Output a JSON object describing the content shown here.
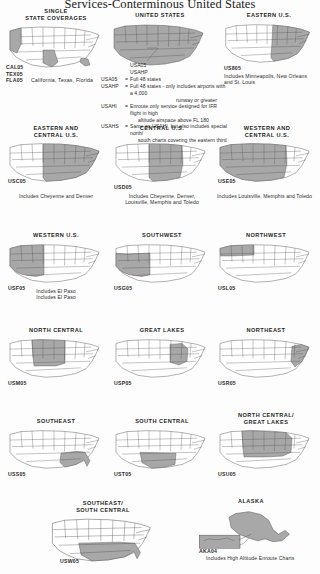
{
  "document": {
    "title": "Services-Conterminous United States"
  },
  "panels": [
    {
      "id": "single-state-coverages",
      "title": "SINGLE\nSTATE COVERAGES",
      "code": "",
      "caption": "",
      "shaded": [
        "CA",
        "TX",
        "FL"
      ]
    },
    {
      "id": "united-states",
      "title": "UNITED STATES",
      "code": "",
      "caption": "",
      "shaded": [
        "ALL48"
      ]
    },
    {
      "id": "eastern-us",
      "title": "EASTERN U.S.",
      "code": "US805",
      "caption": "Includes Minneapolis, New Orleans\nand St. Louis",
      "shaded": [
        "EAST"
      ]
    },
    {
      "id": "eastern-and-central-us",
      "title": "EASTERN AND\nCENTRAL U.S.",
      "code": "USC05",
      "caption": "Includes Cheyenne and Denver",
      "shaded": [
        "EASTCENTRAL"
      ]
    },
    {
      "id": "central-us",
      "title": "CENTRAL U.S.",
      "code": "USD05",
      "caption": "Includes Cheyenne, Denver,\nLouisville, Memphis and Toledo",
      "shaded": [
        "CENTRAL"
      ]
    },
    {
      "id": "western-and-central-us",
      "title": "WESTERN AND\nCENTRAL U.S.",
      "code": "USE05",
      "caption": "Includes Louisville, Memphis and Toledo",
      "shaded": [
        "WESTCENTRAL"
      ]
    },
    {
      "id": "western-us",
      "title": "WESTERN U.S.",
      "code": "USF05",
      "caption": "Includes El Paso",
      "shaded": [
        "WEST"
      ]
    },
    {
      "id": "southwest",
      "title": "SOUTHWEST",
      "code": "USG05",
      "caption": "",
      "shaded": [
        "SOUTHWEST"
      ]
    },
    {
      "id": "northwest",
      "title": "NORTHWEST",
      "code": "USL05",
      "caption": "",
      "shaded": [
        "NORTHWEST"
      ]
    },
    {
      "id": "north-central",
      "title": "NORTH CENTRAL",
      "code": "USM05",
      "caption": "",
      "shaded": [
        "NORTHCENTRAL"
      ]
    },
    {
      "id": "great-lakes",
      "title": "GREAT LAKES",
      "code": "USP05",
      "caption": "",
      "shaded": [
        "GREATLAKES"
      ]
    },
    {
      "id": "northeast",
      "title": "NORTHEAST",
      "code": "USR05",
      "caption": "",
      "shaded": [
        "NORTHEAST"
      ]
    },
    {
      "id": "southeast",
      "title": "SOUTHEAST",
      "code": "USS05",
      "caption": "",
      "shaded": [
        "SOUTHEAST"
      ]
    },
    {
      "id": "south-central",
      "title": "SOUTH CENTRAL",
      "code": "UST05",
      "caption": "",
      "shaded": [
        "SOUTHCENTRAL"
      ]
    },
    {
      "id": "north-central-great-lakes",
      "title": "NORTH CENTRAL/\nGREAT LAKES",
      "code": "USU05",
      "caption": "",
      "shaded": [
        "NCGL"
      ]
    },
    {
      "id": "southeast-south-central",
      "title": "SOUTHEAST/\nSOUTH CENTRAL",
      "code": "USW05",
      "caption": "",
      "shaded": [
        "SESC"
      ]
    },
    {
      "id": "alaska",
      "title": "ALASKA",
      "code": "AKA04",
      "caption": "Includes High Altitude Enroute Charts",
      "shaded": [
        "AK"
      ]
    }
  ],
  "state_codes": [
    {
      "code": "CAL05",
      "label": ""
    },
    {
      "code": "TEX05",
      "label": ""
    },
    {
      "code": "FLA05",
      "label": "California, Texas, Florida"
    }
  ],
  "us_legend": {
    "headers": [
      "USA05",
      "USAHP"
    ],
    "rows": [
      {
        "code": "USA05",
        "eq": "=",
        "text": "Full 48 states"
      },
      {
        "code": "USAHP",
        "eq": "=",
        "text": "Full 48 states - only includes airports with a 4,000"
      },
      {
        "code": "",
        "eq": "",
        "text": "runway or greater",
        "indent": true
      },
      {
        "code": "USAHI",
        "eq": "=",
        "text": "Enroute only service designed for IFR flight in high"
      },
      {
        "code": "",
        "eq": "",
        "text": "altitude airspace above FL 180",
        "indent": true
      },
      {
        "code": "USAHS",
        "eq": "=",
        "text": "Same as USAHI, but also includes special north/"
      },
      {
        "code": "",
        "eq": "",
        "text": "south charts covering the eastern third of the country",
        "indent": true
      }
    ]
  },
  "colors": {
    "shade": "#a8a8a8",
    "outline": "#4d4d4d",
    "text": "#2b2b2b",
    "background": "#fdfdfd"
  }
}
